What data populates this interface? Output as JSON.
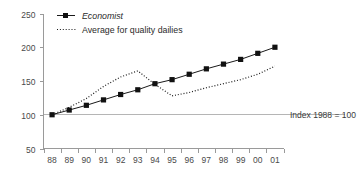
{
  "chart_data": {
    "type": "line",
    "title": "",
    "xlabel": "",
    "ylabel": "",
    "ylim": [
      50,
      250
    ],
    "yticks": [
      50,
      100,
      150,
      200,
      250
    ],
    "grid": false,
    "legend_position": "top-left",
    "categories": [
      "88",
      "89",
      "90",
      "91",
      "92",
      "93",
      "94",
      "95",
      "96",
      "97",
      "98",
      "99",
      "00",
      "01"
    ],
    "annotations": [
      {
        "name": "index-note",
        "text": "Index 1988 = 100",
        "value": 100,
        "type": "reference-line"
      }
    ],
    "series": [
      {
        "name": "Economist",
        "style": "solid-with-square-markers",
        "italic_label": true,
        "values": [
          100,
          107,
          114,
          122,
          130,
          137,
          146,
          152,
          160,
          168,
          175,
          182,
          191,
          200
        ]
      },
      {
        "name": "Average for quality dailies",
        "style": "dotted",
        "italic_label": false,
        "values": [
          100,
          111,
          124,
          142,
          156,
          165,
          145,
          128,
          133,
          140,
          146,
          152,
          160,
          172
        ]
      }
    ]
  },
  "legend": {
    "items": [
      {
        "label": "Economist",
        "marker": "square-with-line",
        "italic": true
      },
      {
        "label": "Average for quality dailies",
        "marker": "dotted-line",
        "italic": false
      }
    ]
  },
  "axes": {
    "y_tick_labels": [
      "250",
      "200",
      "150",
      "100",
      "50"
    ],
    "x_tick_labels": [
      "88",
      "89",
      "90",
      "91",
      "92",
      "93",
      "94",
      "95",
      "96",
      "97",
      "98",
      "99",
      "00",
      "01"
    ]
  },
  "note": {
    "text": "Index 1988 = 100"
  },
  "colors": {
    "series_line": "#1a1a1a",
    "axis": "#9a9a9a",
    "reference_line": "#b5b5b5",
    "text": "#3a3a3a",
    "background": "#ffffff"
  }
}
